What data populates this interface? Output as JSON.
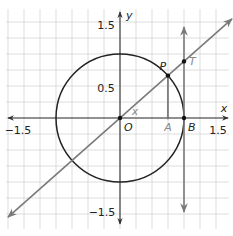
{
  "diagram": {
    "x_range": [
      -1.75,
      1.75
    ],
    "y_range": [
      -1.75,
      1.75
    ],
    "grid_step": 0.25,
    "angle_deg": 41.5,
    "circle_radius": 1,
    "colors": {
      "grid": "#d4d4d4",
      "axis": "#333333",
      "circle": "#222222",
      "secant_line": "#7a7a7a",
      "tangent_line": "#7a7a7a",
      "segment_PA": "#7a7a7a",
      "points": "#111111",
      "gray_label": "#8a8a8a"
    },
    "axis_labels": {
      "x": "x",
      "y": "y"
    },
    "tick_labels": {
      "x_neg": "−1.5",
      "x_pos": "1.5",
      "y_pos": "1.5",
      "y_half": "0.5",
      "y_neg": "−1.5"
    },
    "tick_values": {
      "x_neg": -1.5,
      "x_pos": 1.5,
      "y_pos": 1.5,
      "y_half": 0.5,
      "y_neg": -1.5
    },
    "points": {
      "O": {
        "label": "O"
      },
      "A": {
        "label": "A"
      },
      "B": {
        "label": "B"
      },
      "P": {
        "label": "P"
      },
      "T": {
        "label": "T"
      }
    },
    "angle_label": "x"
  }
}
